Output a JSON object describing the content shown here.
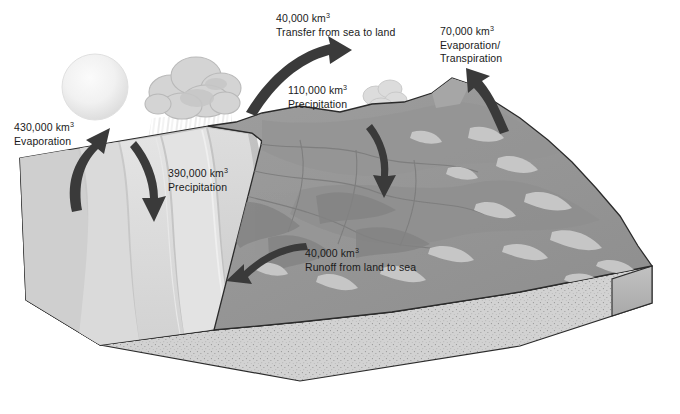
{
  "figure": {
    "type": "diagram",
    "units": "km3 per year"
  },
  "labels": {
    "evaporation_sea": {
      "value": "430,000 km",
      "exponent": "3",
      "caption": "Evaporation",
      "caption2": "",
      "arrow": "curved-arrow-up-left"
    },
    "transfer_sea_to_land": {
      "value": "40,000 km",
      "exponent": "3",
      "caption": "Transfer from sea to land",
      "caption2": "",
      "arrow": "curved-arrow-right"
    },
    "evaporation_transpiration": {
      "value": "70,000 km",
      "exponent": "3",
      "caption": "Evaporation/",
      "caption2": "Transpiration",
      "arrow": "curved-arrow-up-left"
    },
    "precipitation_land": {
      "value": "110,000 km",
      "exponent": "3",
      "caption": "Precipitation",
      "caption2": "",
      "arrow": "curved-arrow-down"
    },
    "precipitation_sea": {
      "value": "390,000 km",
      "exponent": "3",
      "caption": "Precipitation",
      "caption2": "",
      "arrow": "curved-arrow-down"
    },
    "runoff_land_to_sea": {
      "value": "40,000 km",
      "exponent": "3",
      "caption": "Runoff from land to sea",
      "caption2": "",
      "arrow": "curved-arrow-left"
    }
  },
  "scene": {
    "sun": "sun-icon",
    "cloud_large": "cloud-icon",
    "cloud_small": "cloud-icon",
    "rain": "rain-streaks",
    "sea": "sea-surface",
    "land": "mountain-terrain",
    "substrate": "stippled-rock-layer"
  },
  "colors": {
    "background": "#ffffff",
    "outline": "#2b2b2b",
    "arrow": "#3a3a3a",
    "sea_light": "#d7d7d7",
    "sea_mid": "#c4c4c4",
    "sea_dark": "#b2b2b2",
    "land_mid": "#9a9a9a",
    "land_dark": "#8a8a8a",
    "land_light": "#c8c8c8",
    "block_side": "#b8b8b8",
    "block_front": "#cfcfcf",
    "cloud": "#d2d2d2",
    "sun": "#ededed",
    "text": "#1a1a1a"
  }
}
